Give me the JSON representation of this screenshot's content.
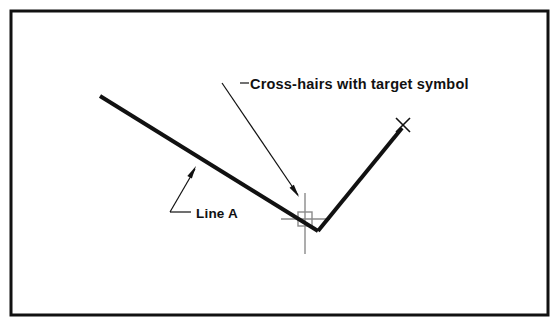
{
  "figure": {
    "kind": "technical-line-diagram",
    "background_color": "#ffffff",
    "frame": {
      "name": "diagram-border",
      "stroke_color": "#111111",
      "stroke_width": 3,
      "x": 11,
      "y": 11,
      "width": 537,
      "height": 304
    },
    "geometry": {
      "line_a": {
        "label": "Line A",
        "stroke_color": "#111111",
        "stroke_width": 4,
        "start": {
          "x": 100,
          "y": 96
        },
        "end": {
          "x": 318,
          "y": 231
        }
      },
      "line_b": {
        "label": "",
        "stroke_color": "#111111",
        "stroke_width": 4,
        "start": {
          "x": 318,
          "y": 231
        },
        "end": {
          "x": 402,
          "y": 128
        }
      },
      "vertex": {
        "x": 318,
        "y": 231
      }
    },
    "endpoint_marker": {
      "name": "x-endpoint-marker",
      "symbol": "x",
      "x": 403,
      "y": 125,
      "size": 7,
      "stroke_color": "#111111",
      "stroke_width": 1.6
    },
    "crosshair": {
      "name": "crosshair-with-target",
      "center": {
        "x": 305,
        "y": 219
      },
      "stroke_color": "#8a8a8a",
      "stroke_width": 1.4,
      "horizontal_span": {
        "x1": 281,
        "x2": 330
      },
      "vertical_span": {
        "y1": 193,
        "y2": 254
      },
      "target_box": {
        "x": 298,
        "y": 212,
        "width": 14,
        "height": 14
      }
    },
    "callouts": [
      {
        "id": "callout-crosshair",
        "text": "Cross-hairs with target symbol",
        "text_x": 250,
        "text_y": 89,
        "stub": {
          "x1": 240,
          "y1": 83,
          "x2": 249,
          "y2": 83
        },
        "leader": {
          "x1": 222,
          "y1": 83,
          "x2": 298,
          "y2": 195
        },
        "arrow_tip": {
          "x": 299,
          "y": 197
        },
        "stroke_color": "#111111",
        "stroke_width": 1.2
      },
      {
        "id": "callout-line-a",
        "text": "Line A",
        "text_x": 196,
        "text_y": 218,
        "stub": {
          "x1": 170,
          "y1": 212,
          "x2": 191,
          "y2": 212
        },
        "leader": {
          "x1": 170,
          "y1": 212,
          "x2": 195,
          "y2": 169
        },
        "arrow_tip": {
          "x": 196,
          "y": 166
        },
        "stroke_color": "#111111",
        "stroke_width": 1.2
      }
    ]
  }
}
